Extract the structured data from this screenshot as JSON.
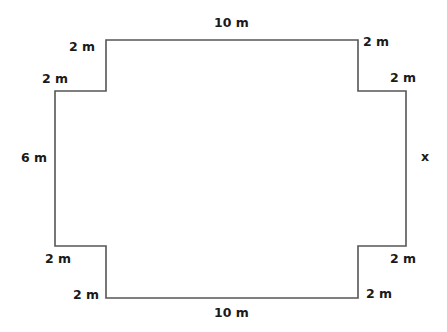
{
  "diagram": {
    "type": "floor-plan-perimeter",
    "stroke_color": "#555555",
    "vertices": [
      [
        106,
        40
      ],
      [
        358,
        40
      ],
      [
        358,
        91
      ],
      [
        406,
        91
      ],
      [
        406,
        246
      ],
      [
        358,
        246
      ],
      [
        358,
        298
      ],
      [
        106,
        298
      ],
      [
        106,
        246
      ],
      [
        55,
        246
      ],
      [
        55,
        91
      ],
      [
        106,
        91
      ]
    ],
    "labels": {
      "top": "10 m",
      "bottom": "10 m",
      "left": "6 m",
      "right": "x",
      "top_left_step_vertical": "2 m",
      "top_left_step_horizontal": "2 m",
      "top_right_step_vertical": "2 m",
      "top_right_step_horizontal": "2 m",
      "bottom_left_step_horizontal": "2 m",
      "bottom_left_step_vertical": "2 m",
      "bottom_right_step_horizontal": "2 m",
      "bottom_right_step_vertical": "2 m"
    }
  }
}
